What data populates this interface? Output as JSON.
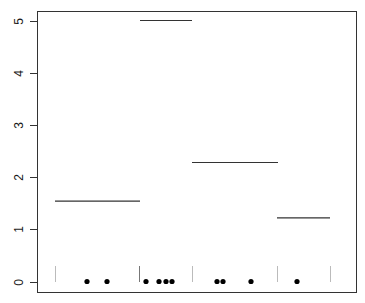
{
  "chart_data": {
    "type": "line",
    "title": "",
    "xlabel": "",
    "ylabel": "",
    "ylim": [
      0,
      5
    ],
    "xaxis_visible": false,
    "grid": false,
    "legend": null,
    "yticks": [
      0,
      1,
      2,
      3,
      4,
      5
    ],
    "ytick_labels": [
      "0",
      "1",
      "2",
      "3",
      "4",
      "5"
    ],
    "segments": [
      {
        "x_start_px": 55,
        "x_end_px": 140,
        "mean": 1.54
      },
      {
        "x_start_px": 140,
        "x_end_px": 192,
        "mean": 5.0
      },
      {
        "x_start_px": 192,
        "x_end_px": 278,
        "mean": 2.28
      },
      {
        "x_start_px": 277,
        "x_end_px": 330,
        "mean": 1.22
      }
    ],
    "boundary_marks": [
      {
        "x_px": 55,
        "color": "#bbbbbb"
      },
      {
        "x_px": 139,
        "color": "#777777"
      },
      {
        "x_px": 192,
        "color": "#bbbbbb"
      },
      {
        "x_px": 277,
        "color": "#bbbbbb"
      },
      {
        "x_px": 330,
        "color": "#bbbbbb"
      }
    ],
    "points": {
      "y": 0,
      "x_px": [
        87,
        107,
        146,
        159,
        166,
        172,
        217,
        223,
        251,
        297
      ]
    }
  },
  "plot_area": {
    "left": 37,
    "right": 356,
    "top": 11,
    "bottom": 292
  },
  "y_scale": {
    "y0_px": 281.5,
    "px_per_unit": 52.2
  },
  "colors": {
    "axis": "#333333",
    "line": "#333333",
    "point": "#000000"
  }
}
